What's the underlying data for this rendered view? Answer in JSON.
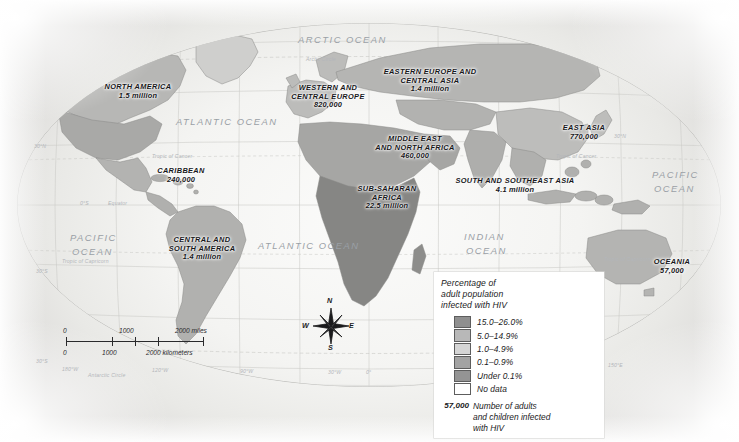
{
  "map": {
    "title": "World HIV prevalence map",
    "regions": [
      {
        "name": "NORTH AMERICA",
        "value": "1.5 million"
      },
      {
        "name": "CARIBBEAN",
        "value": "240,000"
      },
      {
        "name": "CENTRAL AND SOUTH AMERICA",
        "value": "1.4 million"
      },
      {
        "name": "WESTERN AND CENTRAL EUROPE",
        "value": "820,000"
      },
      {
        "name": "EASTERN EUROPE AND CENTRAL ASIA",
        "value": "1.4 million"
      },
      {
        "name": "MIDDLE EAST AND NORTH AFRICA",
        "value": "460,000"
      },
      {
        "name": "SUB-SAHARAN AFRICA",
        "value": "22.5 million"
      },
      {
        "name": "EAST ASIA",
        "value": "770,000"
      },
      {
        "name": "SOUTH AND SOUTHEAST ASIA",
        "value": "4.1 million"
      },
      {
        "name": "OCEANIA",
        "value": "57,000"
      }
    ],
    "region_lines": {
      "north_america": [
        "NORTH AMERICA",
        "1.5 million"
      ],
      "caribbean": [
        "CARIBBEAN",
        "240,000"
      ],
      "central_south_america": [
        "CENTRAL AND",
        "SOUTH AMERICA",
        "1.4 million"
      ],
      "western_central_europe": [
        "WESTERN AND",
        "CENTRAL EUROPE",
        "820,000"
      ],
      "eastern_europe": [
        "EASTERN EUROPE AND",
        "CENTRAL ASIA",
        "1.4 million"
      ],
      "middle_east": [
        "MIDDLE EAST",
        "AND NORTH AFRICA",
        "460,000"
      ],
      "sub_saharan": [
        "SUB-SAHARAN",
        "AFRICA",
        "22.5 million"
      ],
      "east_asia": [
        "EAST ASIA",
        "770,000"
      ],
      "south_southeast_asia": [
        "SOUTH AND SOUTHEAST ASIA",
        "4.1 million"
      ],
      "oceania": [
        "OCEANIA",
        "57,000"
      ]
    },
    "oceans": {
      "arctic": "ARCTIC OCEAN",
      "atlantic_north": "ATLANTIC OCEAN",
      "atlantic_south": "ATLANTIC OCEAN",
      "pacific_west": "PACIFIC OCEAN",
      "pacific_east_l1": "PACIFIC",
      "pacific_east_l2": "OCEAN",
      "pacific_west_l1": "PACIFIC",
      "pacific_west_l2": "OCEAN",
      "indian_l1": "INDIAN",
      "indian_l2": "OCEAN"
    },
    "graticule": {
      "arctic_circle": "Arctic Circle",
      "antarctic_circle": "Antarctic Circle",
      "tropic_cancer_1": "Tropic of Cancer",
      "tropic_cancer_2": "Tropic of Cancer",
      "tropic_capricorn_1": "Tropic of Capricorn",
      "tropic_capricorn_2": "Tropic of Capricorn",
      "equator": "Equator",
      "lat_30n": "30°N",
      "lat_0s": "0°S",
      "lat_30s": "30°S",
      "lon_180w": "180°W",
      "lon_120w": "120°W",
      "lon_90w": "90°W",
      "lon_30w": "30°W",
      "lon_0": "0°",
      "lon_30e": "30°E",
      "lon_90e": "90°E",
      "lon_150e": "150°E",
      "lon_120e": "120°E",
      "lon_30n_right": "30°N"
    }
  },
  "legend": {
    "title_l1": "Percentage of",
    "title_l2": "adult population",
    "title_l3": "infected with HIV",
    "classes": [
      {
        "label": "15.0–26.0%",
        "color": "#8f8f8f"
      },
      {
        "label": "5.0–14.9%",
        "color": "#b8b8b8"
      },
      {
        "label": "1.0–4.9%",
        "color": "#d5d5d5"
      },
      {
        "label": "0.1–0.9%",
        "color": "#a3a3a3"
      },
      {
        "label": "Under 0.1%",
        "color": "#949494"
      },
      {
        "label": "No data",
        "color": "#ffffff"
      }
    ],
    "note_number": "57,000",
    "note_l1": "Number of adults",
    "note_l2": "and children infected",
    "note_l3": "with HIV"
  },
  "scalebar": {
    "miles_0": "0",
    "miles_1000": "1000",
    "miles_2000": "2000 miles",
    "km_0": "0",
    "km_1000": "1000",
    "km_2000": "2000 kilometers"
  },
  "compass": {
    "n": "N",
    "e": "E",
    "s": "S",
    "w": "W"
  }
}
